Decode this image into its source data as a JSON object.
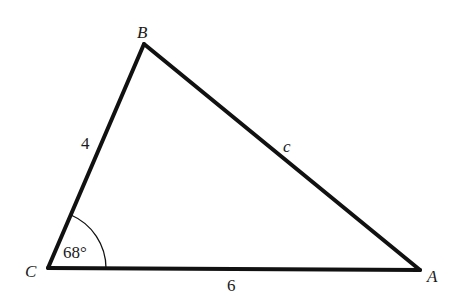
{
  "diagram": {
    "type": "triangle",
    "vertices": [
      {
        "name": "B",
        "label": "B",
        "x": 144,
        "y": 44
      },
      {
        "name": "C",
        "label": "C",
        "x": 48,
        "y": 268
      },
      {
        "name": "A",
        "label": "A",
        "x": 420,
        "y": 270
      }
    ],
    "sides": [
      {
        "between": "C-B",
        "label": "4"
      },
      {
        "between": "B-A",
        "label": "c"
      },
      {
        "between": "C-A",
        "label": "6"
      }
    ],
    "angle": {
      "vertex": "C",
      "label": "68°"
    },
    "colors": {
      "stroke": "#111111",
      "text": "#1a1a1a",
      "background": "#ffffff"
    }
  }
}
